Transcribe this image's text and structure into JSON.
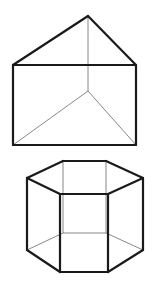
{
  "figure": {
    "description": "Two wireframe geometric solids: a triangular prism above and a hexagonal prism below",
    "colors": {
      "background": "#ffffff",
      "visible_edge": "#1a1a1a",
      "hidden_edge": "#6a6a6a"
    },
    "shapes": [
      {
        "name": "triangular-prism",
        "visible_edges": [
          [
            [
              13,
              65
            ],
            [
              88,
              16
            ]
          ],
          [
            [
              88,
              16
            ],
            [
              136,
              65
            ]
          ],
          [
            [
              13,
              65
            ],
            [
              136,
              65
            ]
          ],
          [
            [
              13,
              65
            ],
            [
              13,
              145
            ]
          ],
          [
            [
              136,
              65
            ],
            [
              136,
              145
            ]
          ],
          [
            [
              13,
              145
            ],
            [
              136,
              145
            ]
          ]
        ],
        "hidden_edges": [
          [
            [
              88,
              16
            ],
            [
              88,
              91
            ]
          ],
          [
            [
              88,
              91
            ],
            [
              13,
              145
            ]
          ],
          [
            [
              88,
              91
            ],
            [
              136,
              145
            ]
          ]
        ]
      },
      {
        "name": "hexagonal-prism",
        "visible_edges": [
          [
            [
              27,
              178
            ],
            [
              63,
              161
            ]
          ],
          [
            [
              63,
              161
            ],
            [
              106,
              161
            ]
          ],
          [
            [
              106,
              161
            ],
            [
              143,
              178
            ]
          ],
          [
            [
              143,
              178
            ],
            [
              108,
              194
            ]
          ],
          [
            [
              108,
              194
            ],
            [
              60,
              194
            ]
          ],
          [
            [
              60,
              194
            ],
            [
              27,
              178
            ]
          ],
          [
            [
              27,
              178
            ],
            [
              27,
              250
            ]
          ],
          [
            [
              60,
              194
            ],
            [
              60,
              272
            ]
          ],
          [
            [
              108,
              194
            ],
            [
              108,
              272
            ]
          ],
          [
            [
              143,
              178
            ],
            [
              143,
              250
            ]
          ],
          [
            [
              27,
              250
            ],
            [
              60,
              272
            ]
          ],
          [
            [
              60,
              272
            ],
            [
              108,
              272
            ]
          ],
          [
            [
              108,
              272
            ],
            [
              143,
              250
            ]
          ]
        ],
        "hidden_edges": [
          [
            [
              63,
              161
            ],
            [
              63,
              233
            ]
          ],
          [
            [
              106,
              161
            ],
            [
              106,
              233
            ]
          ],
          [
            [
              27,
              250
            ],
            [
              63,
              233
            ]
          ],
          [
            [
              63,
              233
            ],
            [
              106,
              233
            ]
          ],
          [
            [
              106,
              233
            ],
            [
              143,
              250
            ]
          ]
        ]
      }
    ]
  }
}
